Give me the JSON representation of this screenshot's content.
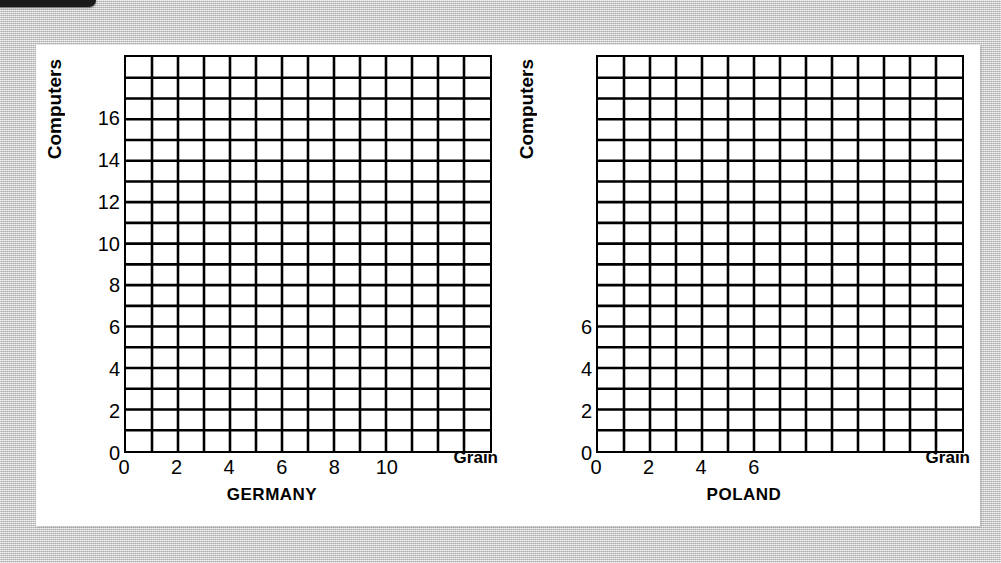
{
  "background": {
    "page_color": "#c9c9c9",
    "card_color": "#ffffff",
    "tab_color": "#1a1a1a"
  },
  "chart_data": [
    {
      "type": "grid",
      "title": "GERMANY",
      "xlabel": "Grain",
      "ylabel": "Computers",
      "xlim": [
        0,
        14
      ],
      "ylim": [
        0,
        19
      ],
      "grid": true,
      "grid_cols": 14,
      "grid_rows": 19,
      "x_ticks": [
        {
          "label": "0",
          "value": 0
        },
        {
          "label": "2",
          "value": 2
        },
        {
          "label": "4",
          "value": 4
        },
        {
          "label": "6",
          "value": 6
        },
        {
          "label": "8",
          "value": 8
        },
        {
          "label": "10",
          "value": 10
        }
      ],
      "y_ticks": [
        {
          "label": "0",
          "value": 0
        },
        {
          "label": "2",
          "value": 2
        },
        {
          "label": "4",
          "value": 4
        },
        {
          "label": "6",
          "value": 6
        },
        {
          "label": "8",
          "value": 8
        },
        {
          "label": "10",
          "value": 10
        },
        {
          "label": "12",
          "value": 12
        },
        {
          "label": "14",
          "value": 14
        },
        {
          "label": "16",
          "value": 16
        }
      ],
      "series": [],
      "values": []
    },
    {
      "type": "grid",
      "title": "POLAND",
      "xlabel": "Grain",
      "ylabel": "Computers",
      "xlim": [
        0,
        14
      ],
      "ylim": [
        0,
        19
      ],
      "grid": true,
      "grid_cols": 14,
      "grid_rows": 19,
      "x_ticks": [
        {
          "label": "0",
          "value": 0
        },
        {
          "label": "2",
          "value": 2
        },
        {
          "label": "4",
          "value": 4
        },
        {
          "label": "6",
          "value": 6
        }
      ],
      "y_ticks": [
        {
          "label": "0",
          "value": 0
        },
        {
          "label": "2",
          "value": 2
        },
        {
          "label": "4",
          "value": 4
        },
        {
          "label": "6",
          "value": 6
        }
      ],
      "series": [],
      "values": []
    }
  ]
}
